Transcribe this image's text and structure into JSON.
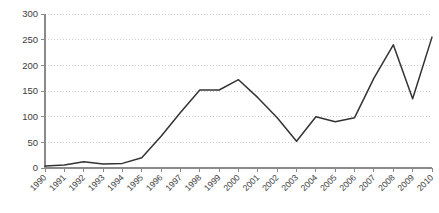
{
  "chart_data": {
    "type": "line",
    "title": "",
    "subtitle": "",
    "xlabel": "",
    "ylabel": "",
    "categories": [
      "1990",
      "1991",
      "1992",
      "1993",
      "1994",
      "1995",
      "1996",
      "1997",
      "1998",
      "1999",
      "2000",
      "2001",
      "2002",
      "2003",
      "2004",
      "2005",
      "2006",
      "2007",
      "2008",
      "2009",
      "2010"
    ],
    "values": [
      4,
      6,
      12,
      8,
      9,
      20,
      62,
      108,
      152,
      152,
      172,
      137,
      98,
      52,
      100,
      90,
      98,
      175,
      240,
      135,
      255
    ],
    "series": [
      {
        "name": "series-1",
        "values": [
          4,
          6,
          12,
          8,
          9,
          20,
          62,
          108,
          152,
          152,
          172,
          137,
          98,
          52,
          100,
          90,
          98,
          175,
          240,
          135,
          255
        ],
        "color": "#333333"
      }
    ],
    "ylim": [
      0,
      300
    ],
    "yticks": [
      0,
      50,
      100,
      150,
      200,
      250,
      300
    ],
    "ytick_labels": [
      "0",
      "50",
      "100",
      "150",
      "200",
      "250",
      "300"
    ],
    "xtick_labels": [
      "1990",
      "1991",
      "1992",
      "1993",
      "1994",
      "1995",
      "1996",
      "1997",
      "1998",
      "1999",
      "2000",
      "2001",
      "2002",
      "2003",
      "2004",
      "2005",
      "2006",
      "2007",
      "2008",
      "2009",
      "2010"
    ],
    "grid": true,
    "grid_axis": "y",
    "grid_style": "dotted",
    "legend": false,
    "legend_position": "none",
    "xtick_label_rotation": -45,
    "colors": {
      "line": "#333333",
      "grid": "#d0d0d0",
      "axis": "#8a8a8a",
      "text": "#3c3c3c",
      "background": "#ffffff"
    }
  },
  "layout": {
    "plot_left": 45,
    "plot_right": 432,
    "plot_top": 14,
    "plot_bottom": 168
  }
}
